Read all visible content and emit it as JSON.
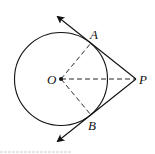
{
  "diagram": {
    "type": "geometry-tangents",
    "colors": {
      "stroke": "#111111",
      "background": "#ffffff",
      "footer_line": "#cccccc"
    },
    "circle": {
      "center": [
        61,
        79
      ],
      "radius": 46.5
    },
    "points": {
      "O": {
        "label": "O",
        "x": 61,
        "y": 79
      },
      "A": {
        "label": "A",
        "x": 91,
        "y": 43
      },
      "B": {
        "label": "B",
        "x": 91,
        "y": 115
      },
      "P": {
        "label": "P",
        "x": 136,
        "y": 79
      }
    },
    "solid_lines": [
      {
        "name": "tangent-PA",
        "from": "P",
        "to": [
          57,
          16
        ],
        "arrow": true
      },
      {
        "name": "tangent-PB",
        "from": "P",
        "to": [
          57,
          142
        ],
        "arrow": true
      }
    ],
    "dashed_lines": [
      {
        "name": "segment-OA",
        "from": "O",
        "to": "A"
      },
      {
        "name": "segment-OB",
        "from": "O",
        "to": "B"
      },
      {
        "name": "segment-OP",
        "from": "O",
        "to": "P"
      }
    ],
    "labels": {
      "A": "A",
      "B": "B",
      "O": "O",
      "P": "P"
    }
  }
}
